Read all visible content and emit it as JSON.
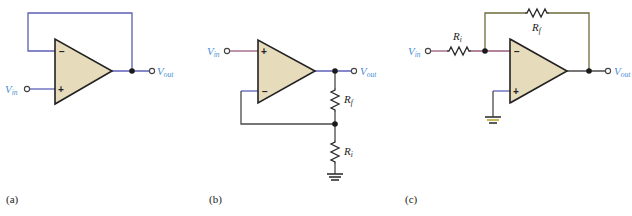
{
  "figure": {
    "subfigures": [
      {
        "caption": "(a)",
        "description": "voltage follower",
        "labels": {
          "vin": "V",
          "vin_sub": "in",
          "vout": "V",
          "vout_sub": "out"
        },
        "inputs": {
          "inverting": "−",
          "noninverting": "+"
        }
      },
      {
        "caption": "(b)",
        "description": "non-inverting amplifier",
        "labels": {
          "vin": "V",
          "vin_sub": "in",
          "vout": "V",
          "vout_sub": "out",
          "rf": "R",
          "rf_sub": "f",
          "ri": "R",
          "ri_sub": "i"
        },
        "inputs": {
          "inverting": "−",
          "noninverting": "+"
        }
      },
      {
        "caption": "(c)",
        "description": "inverting amplifier",
        "labels": {
          "vin": "V",
          "vin_sub": "in",
          "vout": "V",
          "vout_sub": "out",
          "rf": "R",
          "rf_sub": "f",
          "ri": "R",
          "ri_sub": "i"
        },
        "inputs": {
          "inverting": "−",
          "noninverting": "+"
        }
      }
    ],
    "colors": {
      "opamp_fill": "#e6dcbc",
      "wire_blue": "#5c5fb8",
      "label_blue": "#4a8fd6",
      "ground_yellow": "#b8a830"
    }
  }
}
